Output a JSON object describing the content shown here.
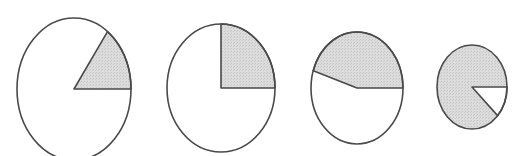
{
  "figure": {
    "fill_color": "#d9d9d9",
    "stroke_color": "#4a4a4a",
    "background": "#ffffff"
  },
  "chart_data": {
    "type": "pie",
    "title": "",
    "pies": [
      {
        "name": "pie-1",
        "cx": 74,
        "cy": 89,
        "rx": 57,
        "ry": 71,
        "shaded_fraction": 0.15,
        "shaded_start_deg": 0,
        "shaded_end_deg": 54
      },
      {
        "name": "pie-2",
        "cx": 221,
        "cy": 88,
        "rx": 54,
        "ry": 64,
        "shaded_fraction": 0.25,
        "shaded_start_deg": 0,
        "shaded_end_deg": 90
      },
      {
        "name": "pie-3",
        "cx": 357,
        "cy": 88,
        "rx": 46,
        "ry": 56,
        "shaded_fraction": 0.45,
        "shaded_start_deg": 0,
        "shaded_end_deg": 162
      },
      {
        "name": "pie-4",
        "cx": 472,
        "cy": 87,
        "rx": 35,
        "ry": 42,
        "shaded_fraction": 0.88,
        "shaded_start_deg": -43,
        "shaded_end_deg": 0,
        "shaded_is_complement": true
      }
    ]
  }
}
